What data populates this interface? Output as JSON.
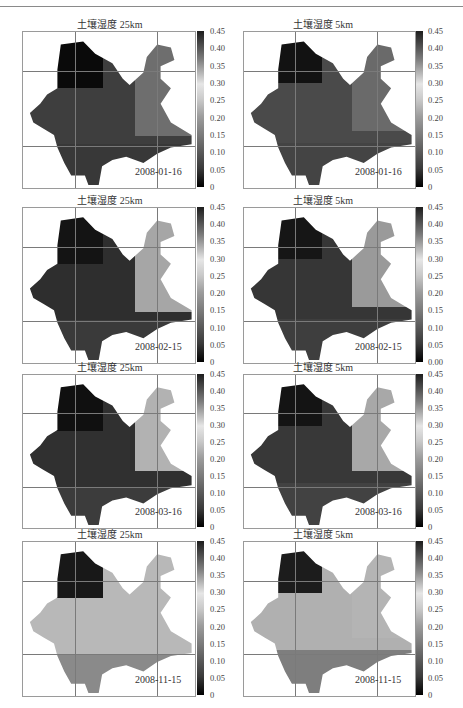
{
  "figure": {
    "rows": 4,
    "cols": 2,
    "colorbar_ticks": [
      "0.45",
      "0.40",
      "0.35",
      "0.30",
      "0.25",
      "0.20",
      "0.15",
      "0.10",
      "0.05",
      "0"
    ],
    "colorbar_ticks_alt": [
      "0.45",
      "0.40",
      "0.35",
      "0.30",
      "0.25",
      "0.20",
      "0.15",
      "0.10",
      "0.05",
      "0.00"
    ]
  },
  "panels": [
    {
      "title": "土壤湿度 25km",
      "date": "2008-01-16",
      "resolution": "25km"
    },
    {
      "title": "土壤湿度 5km",
      "date": "2008-01-16",
      "resolution": "5km"
    },
    {
      "title": "土壤湿度 25km",
      "date": "2008-02-15",
      "resolution": "25km"
    },
    {
      "title": "土壤湿度 5km",
      "date": "2008-02-15",
      "resolution": "5km"
    },
    {
      "title": "土壤湿度 25km",
      "date": "2008-03-16",
      "resolution": "25km"
    },
    {
      "title": "土壤湿度 5km",
      "date": "2008-03-16",
      "resolution": "5km"
    },
    {
      "title": "土壤湿度 25km",
      "date": "2008-11-15",
      "resolution": "25km"
    },
    {
      "title": "土壤湿度 5km",
      "date": "2008-11-15",
      "resolution": "5km"
    }
  ],
  "chart_data": [
    {
      "type": "heatmap",
      "title": "土壤湿度 25km",
      "annotation": "2008-01-16",
      "colorbar": {
        "min": 0,
        "max": 0.45,
        "ticks": [
          0,
          0.05,
          0.1,
          0.15,
          0.2,
          0.25,
          0.3,
          0.35,
          0.4,
          0.45
        ]
      },
      "grid": true,
      "description": "Soil moisture map, 25km grid; dark (high ~0.45) in northwest, mostly ~0.05-0.15 elsewhere, lighter in northeast"
    },
    {
      "type": "heatmap",
      "title": "土壤湿度 5km",
      "annotation": "2008-01-16",
      "colorbar": {
        "min": 0,
        "max": 0.45,
        "ticks": [
          0,
          0.05,
          0.1,
          0.15,
          0.2,
          0.25,
          0.3,
          0.35,
          0.4,
          0.45
        ]
      },
      "grid": true,
      "description": "Soil moisture map, 5km grid; high in northwest, mixed medium values elsewhere"
    },
    {
      "type": "heatmap",
      "title": "土壤湿度 25km",
      "annotation": "2008-02-15",
      "colorbar": {
        "min": 0,
        "max": 0.45,
        "ticks": [
          0,
          0.05,
          0.1,
          0.15,
          0.2,
          0.25,
          0.3,
          0.35,
          0.4,
          0.45
        ]
      },
      "grid": true,
      "description": "Dark northwest and central band, lighter (~0.25-0.30) in northeast and east"
    },
    {
      "type": "heatmap",
      "title": "土壤湿度 5km",
      "annotation": "2008-02-15",
      "colorbar": {
        "min": 0,
        "max": 0.45,
        "ticks": [
          0,
          0.05,
          0.1,
          0.15,
          0.2,
          0.25,
          0.3,
          0.35,
          0.4,
          0.45
        ],
        "tick_labels": [
          "0.00",
          "0.05",
          "0.10",
          "0.15",
          "0.20",
          "0.25",
          "0.30",
          "0.35",
          "0.40",
          "0.45"
        ]
      },
      "grid": true,
      "description": "Dark central/western region, lighter eastern region"
    },
    {
      "type": "heatmap",
      "title": "土壤湿度 25km",
      "annotation": "2008-03-16",
      "colorbar": {
        "min": 0,
        "max": 0.45,
        "ticks": [
          0,
          0.05,
          0.1,
          0.15,
          0.2,
          0.25,
          0.3,
          0.35,
          0.4,
          0.45
        ]
      },
      "grid": true,
      "description": "Dark west and central diagonal, light northeast (~0.3)"
    },
    {
      "type": "heatmap",
      "title": "土壤湿度 5km",
      "annotation": "2008-03-16",
      "colorbar": {
        "min": 0,
        "max": 0.45,
        "ticks": [
          0,
          0.05,
          0.1,
          0.15,
          0.2,
          0.25,
          0.3,
          0.35,
          0.4,
          0.45
        ]
      },
      "grid": true,
      "description": "Dark west/central, light northeast and east"
    },
    {
      "type": "heatmap",
      "title": "土壤湿度 25km",
      "annotation": "2008-11-15",
      "colorbar": {
        "min": 0,
        "max": 0.45,
        "ticks": [
          0,
          0.05,
          0.1,
          0.15,
          0.2,
          0.25,
          0.3,
          0.35,
          0.4,
          0.45
        ]
      },
      "grid": true,
      "description": "Mostly uniform light (~0.3), dark cells in far northwest and scattered spots"
    },
    {
      "type": "heatmap",
      "title": "土壤湿度 5km",
      "annotation": "2008-11-15",
      "colorbar": {
        "min": 0,
        "max": 0.45,
        "ticks": [
          0,
          0.05,
          0.1,
          0.15,
          0.2,
          0.25,
          0.3,
          0.35,
          0.4,
          0.45
        ]
      },
      "grid": true,
      "description": "Mostly light (~0.3), dark northwest, scattered darker patches"
    }
  ]
}
